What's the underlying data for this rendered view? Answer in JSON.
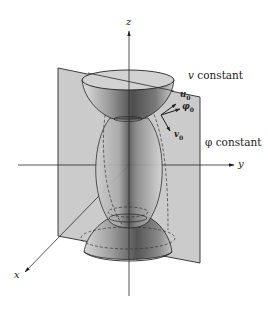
{
  "diagram": {
    "axes": {
      "z": "z",
      "y": "y",
      "x": "x"
    },
    "surfaces": {
      "v_constant": "v constant",
      "phi_constant": "φ constant"
    },
    "unit_vectors": {
      "u0": "u",
      "phi0": "φ",
      "v0": "v",
      "subscript": "0"
    },
    "colors": {
      "plane_fill": "#c9c9c9",
      "surface_dark": "#5a5a5a",
      "surface_light": "#d8d8d8",
      "line": "#1e1e1e"
    }
  }
}
